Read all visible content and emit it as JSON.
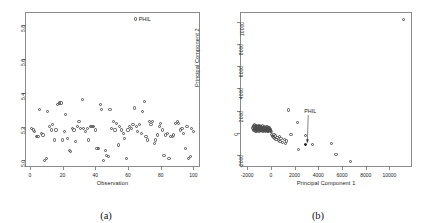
{
  "figure": {
    "panel_a_caption": "(a)",
    "panel_b_caption": "(b)"
  },
  "chart_data": [
    {
      "type": "scatter",
      "panel": "(a)",
      "title": "",
      "xlabel": "Observation",
      "ylabel": "dCor jackknife replicate",
      "xlim": [
        -3,
        104
      ],
      "ylim": [
        4.96,
        5.88
      ],
      "xticks": [
        0,
        20,
        40,
        60,
        80,
        100
      ],
      "xtick_labels": [
        "0",
        "20",
        "40",
        "60",
        "80",
        "100"
      ],
      "yticks": [
        5.0,
        5.2,
        5.4,
        5.6,
        5.8
      ],
      "ytick_labels": [
        "5.0",
        "5.2",
        "5.4",
        "5.6",
        "5.8"
      ],
      "grid": false,
      "legend": {
        "position": "top-right",
        "entries": [
          "PHIL"
        ],
        "marker": "open-circle"
      },
      "x": [
        1,
        2,
        3,
        4,
        5,
        6,
        7,
        8,
        9,
        10,
        11,
        12,
        13,
        14,
        15,
        16,
        17,
        18,
        19,
        20,
        21,
        22,
        23,
        24,
        25,
        26,
        27,
        28,
        29,
        30,
        31,
        32,
        33,
        34,
        35,
        36,
        37,
        38,
        39,
        40,
        41,
        42,
        43,
        44,
        45,
        46,
        47,
        48,
        49,
        50,
        51,
        52,
        53,
        54,
        55,
        56,
        57,
        58,
        59,
        60,
        61,
        62,
        63,
        64,
        65,
        66,
        67,
        68,
        69,
        70,
        71,
        72,
        73,
        74,
        75,
        76,
        77,
        78,
        79,
        80,
        81,
        82,
        83,
        84,
        85,
        86,
        87,
        88,
        89,
        90,
        91,
        92,
        93,
        94,
        95,
        96,
        97,
        98,
        99,
        100
      ],
      "y": [
        5.19,
        5.18,
        5.17,
        5.14,
        5.14,
        5.3,
        5.16,
        5.15,
        5.0,
        5.01,
        5.29,
        5.2,
        5.18,
        5.21,
        5.12,
        5.18,
        5.33,
        5.34,
        5.34,
        5.12,
        5.17,
        5.27,
        5.13,
        5.06,
        5.05,
        5.19,
        5.18,
        5.11,
        5.2,
        5.23,
        5.19,
        5.36,
        5.19,
        5.17,
        5.19,
        5.12,
        5.2,
        5.2,
        5.2,
        5.18,
        5.07,
        5.07,
        5.33,
        5.3,
        5.0,
        5.06,
        5.03,
        5.02,
        5.3,
        5.19,
        5.23,
        5.18,
        5.22,
        5.09,
        5.2,
        5.18,
        5.16,
        5.13,
        5.01,
        5.18,
        5.2,
        5.19,
        5.21,
        5.31,
        5.2,
        5.17,
        5.21,
        5.16,
        5.29,
        5.35,
        5.14,
        5.12,
        5.23,
        5.21,
        5.23,
        5.1,
        5.12,
        5.15,
        5.2,
        5.22,
        5.18,
        5.03,
        5.15,
        5.16,
        5.01,
        5.14,
        5.14,
        5.15,
        5.22,
        5.23,
        5.22,
        5.18,
        5.19,
        5.16,
        5.07,
        5.2,
        5.01,
        5.02,
        5.19,
        5.17
      ]
    },
    {
      "type": "scatter",
      "panel": "(b)",
      "title": "",
      "xlabel": "Principal Component 1",
      "ylabel": "Principal Component 2",
      "xlim": [
        -2600,
        11900
      ],
      "ylim": [
        -3100,
        10900
      ],
      "xticks": [
        -2000,
        0,
        2000,
        4000,
        6000,
        8000,
        10000
      ],
      "xtick_labels": [
        "-2000",
        "0",
        "2000",
        "4000",
        "6000",
        "8000",
        "10000"
      ],
      "yticks": [
        -2000,
        0,
        2000,
        4000,
        6000,
        8000,
        10000
      ],
      "ytick_labels": [
        "-2000",
        "0",
        "2000",
        "4000",
        "6000",
        "8000",
        "10000"
      ],
      "grid": false,
      "annotations": [
        {
          "text": "PHIL",
          "point_x": 2950,
          "point_y": -1050,
          "label_x": 3150,
          "label_y": 1850
        }
      ],
      "x": [
        -1500,
        -1480,
        -1460,
        -1440,
        -1420,
        -1400,
        -1380,
        -1360,
        -1340,
        -1320,
        -1300,
        -1290,
        -1280,
        -1260,
        -1240,
        -1220,
        -1200,
        -1180,
        -1160,
        -1140,
        -1120,
        -1100,
        -1080,
        -1060,
        -1040,
        -1020,
        -1000,
        -980,
        -960,
        -940,
        -920,
        -900,
        -880,
        -860,
        -840,
        -820,
        -800,
        -780,
        -760,
        -740,
        -720,
        -700,
        -680,
        -660,
        -640,
        -620,
        -600,
        -580,
        -560,
        -540,
        -520,
        -500,
        -480,
        -460,
        -440,
        -420,
        -400,
        -380,
        -360,
        -340,
        -320,
        -300,
        -280,
        -260,
        -240,
        -220,
        -200,
        -180,
        -160,
        -140,
        -120,
        -100,
        -80,
        -60,
        -40,
        -20,
        0,
        40,
        80,
        120,
        160,
        200,
        260,
        320,
        380,
        440,
        520,
        620,
        700,
        780,
        860,
        980,
        1180,
        1250,
        1300,
        1500,
        1700,
        2250,
        2350,
        2950,
        3500,
        5100,
        5500,
        6700,
        11200
      ],
      "y": [
        420,
        520,
        300,
        600,
        180,
        450,
        700,
        250,
        380,
        550,
        100,
        620,
        320,
        480,
        200,
        660,
        150,
        400,
        560,
        260,
        340,
        500,
        180,
        600,
        280,
        420,
        120,
        520,
        360,
        640,
        220,
        460,
        300,
        580,
        160,
        400,
        240,
        520,
        340,
        180,
        460,
        280,
        600,
        140,
        380,
        220,
        500,
        320,
        160,
        440,
        260,
        580,
        200,
        360,
        120,
        480,
        300,
        160,
        420,
        240,
        540,
        180,
        340,
        100,
        460,
        220,
        380,
        140,
        300,
        200,
        420,
        160,
        340,
        80,
        260,
        180,
        300,
        120,
        -200,
        -350,
        -250,
        -420,
        -150,
        -500,
        -300,
        -600,
        -450,
        -700,
        -380,
        -820,
        -550,
        -900,
        -650,
        -1000,
        -750,
        2050,
        -200,
        950,
        -1500,
        -250,
        -1050,
        -950,
        -1950,
        -2600,
        10200,
        -2100
      ]
    }
  ]
}
